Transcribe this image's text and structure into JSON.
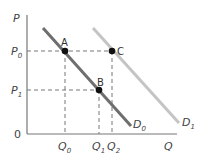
{
  "diagram": {
    "type": "demand-shift",
    "axes": {
      "y_label": "P",
      "x_label": "Q",
      "origin_label": "0"
    },
    "price_levels": [
      {
        "base": "P",
        "sub": "0"
      },
      {
        "base": "P",
        "sub": "1"
      }
    ],
    "quantity_levels": [
      {
        "base": "Q",
        "sub": "0"
      },
      {
        "base": "Q",
        "sub": "1"
      },
      {
        "base": "Q",
        "sub": "2"
      }
    ],
    "curves": [
      {
        "base": "D",
        "sub": "0",
        "color": "#6e6e6e"
      },
      {
        "base": "D",
        "sub": "1",
        "color": "#c4c4c4"
      }
    ],
    "points": [
      {
        "label": "A"
      },
      {
        "label": "B"
      },
      {
        "label": "C"
      }
    ]
  }
}
